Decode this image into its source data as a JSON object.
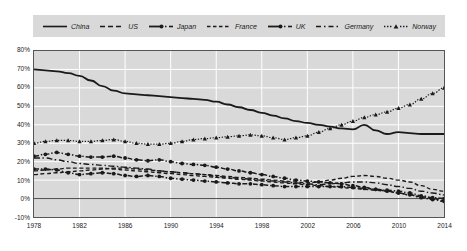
{
  "chart_data": {
    "type": "line",
    "title": "",
    "subtitle": "",
    "xlabel": "",
    "ylabel": "",
    "xlim": [
      1978,
      2014
    ],
    "ylim": [
      -10,
      80
    ],
    "ytick_labels": [
      "80%",
      "70%",
      "60%",
      "50%",
      "40%",
      "30%",
      "20%",
      "10%",
      "0%",
      "-10%"
    ],
    "ytick_values": [
      80,
      70,
      60,
      50,
      40,
      30,
      20,
      10,
      0,
      -10
    ],
    "xtick_labels": [
      "1978",
      "1982",
      "1986",
      "1990",
      "1994",
      "1998",
      "2002",
      "2006",
      "2010",
      "2014"
    ],
    "xtick_values": [
      1978,
      1982,
      1986,
      1990,
      1994,
      1998,
      2002,
      2006,
      2010,
      2014
    ],
    "grid": true,
    "grid_color": "#ffffff",
    "plot_background": "#d9d9d9",
    "legend_position": "top",
    "legend_background": "#d9d9d9",
    "x": [
      1978,
      1979,
      1980,
      1981,
      1982,
      1983,
      1984,
      1985,
      1986,
      1987,
      1988,
      1989,
      1990,
      1991,
      1992,
      1993,
      1994,
      1995,
      1996,
      1997,
      1998,
      1999,
      2000,
      2001,
      2002,
      2003,
      2004,
      2005,
      2006,
      2007,
      2008,
      2009,
      2010,
      2011,
      2012,
      2013,
      2014
    ],
    "series": [
      {
        "name": "China",
        "line_style": "solid",
        "marker": "none",
        "color": "#1a1a1a",
        "values": [
          70,
          69.5,
          69,
          68,
          66.5,
          64,
          61,
          58.5,
          57,
          56.5,
          56,
          55.5,
          55,
          54.5,
          54,
          53.5,
          52.5,
          51,
          49.5,
          48,
          46.5,
          45,
          43.5,
          42,
          41,
          40,
          39,
          38,
          37.5,
          40,
          37,
          35,
          36,
          35.5,
          35,
          35,
          35
        ]
      },
      {
        "name": "US",
        "line_style": "dashed",
        "marker": "none",
        "color": "#1a1a1a",
        "values": [
          13,
          13.5,
          14,
          14.5,
          15,
          15.5,
          16,
          16.5,
          16.5,
          16,
          15.5,
          15,
          14.5,
          14,
          13.5,
          13,
          12.5,
          12,
          11.5,
          11,
          10.5,
          10,
          9.5,
          9,
          8.5,
          9,
          10,
          11,
          12,
          12.5,
          12,
          11,
          10,
          9,
          7,
          5,
          4
        ]
      },
      {
        "name": "Japan",
        "line_style": "dashdot",
        "marker": "circle",
        "color": "#1a1a1a",
        "values": [
          23,
          24,
          25,
          24,
          23,
          22.5,
          22.5,
          23,
          22,
          21,
          20.5,
          21,
          20,
          19,
          18.5,
          18,
          17,
          16,
          15,
          14,
          13,
          12,
          11,
          10,
          9.5,
          9,
          8.5,
          8,
          7,
          6,
          5,
          4.5,
          4,
          3,
          1.5,
          0.5,
          0
        ]
      },
      {
        "name": "France",
        "line_style": "dashed",
        "marker": "none",
        "color": "#1a1a1a",
        "values": [
          15,
          15.5,
          16,
          16.5,
          16.5,
          16.5,
          16.5,
          16,
          15.5,
          15,
          14.5,
          14,
          13.5,
          13,
          12.5,
          12,
          11.5,
          11,
          10.5,
          10,
          9.5,
          9,
          8.5,
          8,
          7.5,
          7,
          6.5,
          6,
          5.5,
          5,
          4.5,
          4,
          3,
          2,
          1,
          0,
          -1
        ]
      },
      {
        "name": "UK",
        "line_style": "dashdot",
        "marker": "circle",
        "color": "#1a1a1a",
        "values": [
          16,
          16,
          15.5,
          14,
          13,
          13.5,
          14,
          13.5,
          12.5,
          12,
          12.5,
          12,
          11,
          10.5,
          10,
          9.5,
          9,
          8.5,
          8,
          8,
          7.5,
          7,
          6.5,
          6.5,
          6.5,
          6.5,
          6.5,
          6.5,
          6,
          5.5,
          5,
          4,
          3,
          2,
          0.5,
          -0.5,
          -1.5
        ]
      },
      {
        "name": "Germany",
        "line_style": "longdashdot",
        "marker": "none",
        "color": "#1a1a1a",
        "values": [
          22,
          22,
          21,
          20,
          19,
          18.5,
          18,
          17.5,
          17,
          16.5,
          16,
          15,
          14.5,
          14,
          13.5,
          13,
          12,
          11.5,
          11,
          10.5,
          10,
          9.5,
          9,
          8.5,
          8,
          7.5,
          8,
          8.5,
          9,
          9,
          8.5,
          7.5,
          6.5,
          5.5,
          4,
          3,
          2
        ]
      },
      {
        "name": "Norway",
        "line_style": "dotted",
        "marker": "triangle",
        "color": "#1a1a1a",
        "values": [
          30,
          31,
          31.5,
          31.5,
          31,
          31,
          31.5,
          32,
          31,
          30,
          29.5,
          29.5,
          30,
          31,
          32,
          32.5,
          33,
          33.5,
          34,
          34.5,
          34,
          33,
          32,
          33,
          34,
          36,
          38,
          40,
          42,
          44,
          45.5,
          47,
          49,
          51,
          54,
          57,
          60
        ]
      }
    ]
  },
  "legend": {
    "items": [
      {
        "label": "China",
        "style": "solid"
      },
      {
        "label": "US",
        "style": "dashed"
      },
      {
        "label": "Japan",
        "style": "dashdot-marker"
      },
      {
        "label": "France",
        "style": "dashed"
      },
      {
        "label": "UK",
        "style": "dashdot-marker"
      },
      {
        "label": "Germany",
        "style": "longdashdot"
      },
      {
        "label": "Norway",
        "style": "dotted-marker"
      }
    ]
  }
}
